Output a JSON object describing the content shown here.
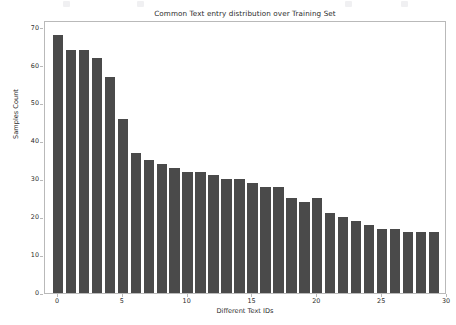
{
  "figure": {
    "background_color": "#ffffff",
    "bar_color": "#4a4a4a",
    "axis_color": "#b9b9b9",
    "text_color": "#2b2b2b"
  },
  "chart_data": {
    "type": "bar",
    "title": "Common Text entry distribution over Training Set",
    "xlabel": "Different Text IDs",
    "ylabel": "Samples Count",
    "categories": [
      0,
      1,
      2,
      3,
      4,
      5,
      6,
      7,
      8,
      9,
      10,
      11,
      12,
      13,
      14,
      15,
      16,
      17,
      18,
      19,
      20,
      21,
      22,
      23,
      24,
      25,
      26,
      27,
      28,
      29
    ],
    "values": [
      68,
      64,
      64,
      62,
      57,
      46,
      37,
      35,
      34,
      33,
      32,
      32,
      31,
      30,
      30,
      29,
      28,
      28,
      25,
      24,
      25,
      21,
      20,
      19,
      18,
      17,
      17,
      16,
      16,
      16
    ],
    "xlim": [
      -1,
      30
    ],
    "ylim": [
      0,
      72
    ],
    "xticks": [
      0,
      5,
      10,
      15,
      20,
      25,
      30
    ],
    "xticklabels": [
      "0",
      "5",
      "10",
      "15",
      "20",
      "25",
      "30"
    ],
    "yticks": [
      0,
      10,
      20,
      30,
      40,
      50,
      60,
      70
    ],
    "yticklabels": [
      "0",
      "10",
      "20",
      "30",
      "40",
      "50",
      "60",
      "70"
    ],
    "grid": false,
    "legend": null,
    "bar_width": 0.8
  }
}
